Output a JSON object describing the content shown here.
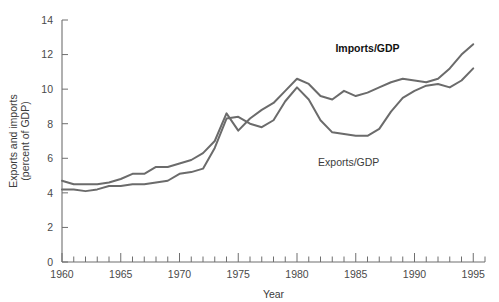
{
  "chart_data": {
    "type": "line",
    "title": "",
    "xlabel": "Year",
    "ylabel": "Exports and imports\n(percent of GDP)",
    "ylabel_line1": "Exports and imports",
    "ylabel_line2": "(percent of GDP)",
    "xlim": [
      1960,
      1996
    ],
    "ylim": [
      0,
      14
    ],
    "y_ticks": [
      0,
      2,
      4,
      6,
      8,
      10,
      12,
      14
    ],
    "y_tick_labels": [
      "0",
      "2",
      "4",
      "6",
      "8",
      "10",
      "12",
      "14"
    ],
    "x_ticks": [
      1960,
      1961,
      1962,
      1963,
      1964,
      1965,
      1966,
      1967,
      1968,
      1969,
      1970,
      1971,
      1972,
      1973,
      1974,
      1975,
      1976,
      1977,
      1978,
      1979,
      1980,
      1981,
      1982,
      1983,
      1984,
      1985,
      1986,
      1987,
      1988,
      1989,
      1990,
      1991,
      1992,
      1993,
      1994,
      1995,
      1996
    ],
    "x_tick_labels": [
      "1960",
      "1965",
      "1970",
      "1975",
      "1980",
      "1985",
      "1990",
      "1995"
    ],
    "x_label_values": [
      1960,
      1965,
      1970,
      1975,
      1980,
      1985,
      1990,
      1995
    ],
    "grid": false,
    "legend_position": "inline-annotation",
    "x": [
      1960,
      1961,
      1962,
      1963,
      1964,
      1965,
      1966,
      1967,
      1968,
      1969,
      1970,
      1971,
      1972,
      1973,
      1974,
      1975,
      1976,
      1977,
      1978,
      1979,
      1980,
      1981,
      1982,
      1983,
      1984,
      1985,
      1986,
      1987,
      1988,
      1989,
      1990,
      1991,
      1992,
      1993,
      1994,
      1995
    ],
    "series": [
      {
        "name": "Imports/GDP",
        "label": "Imports/GDP",
        "color": "#6b6b6b",
        "values": [
          4.7,
          4.5,
          4.5,
          4.5,
          4.6,
          4.8,
          5.1,
          5.1,
          5.5,
          5.5,
          5.7,
          5.9,
          6.3,
          7.0,
          8.6,
          7.6,
          8.3,
          8.8,
          9.2,
          9.9,
          10.6,
          10.3,
          9.6,
          9.4,
          9.9,
          9.6,
          9.8,
          10.1,
          10.4,
          10.6,
          10.5,
          10.4,
          10.6,
          11.2,
          12.0,
          12.6
        ]
      },
      {
        "name": "Exports/GDP",
        "label": "Exports/GDP",
        "color": "#6b6b6b",
        "values": [
          4.2,
          4.2,
          4.1,
          4.2,
          4.4,
          4.4,
          4.5,
          4.5,
          4.6,
          4.7,
          5.1,
          5.2,
          5.4,
          6.6,
          8.3,
          8.4,
          8.0,
          7.8,
          8.2,
          9.3,
          10.1,
          9.4,
          8.2,
          7.5,
          7.4,
          7.3,
          7.3,
          7.7,
          8.7,
          9.5,
          9.9,
          10.2,
          10.3,
          10.1,
          10.5,
          11.2
        ]
      }
    ],
    "annotations": [
      {
        "text": "Imports/GDP",
        "x": 1986.0,
        "y": 12.15,
        "bold": true
      },
      {
        "text": "Exports/GDP",
        "x": 1984.4,
        "y": 5.55,
        "bold": false
      }
    ]
  }
}
